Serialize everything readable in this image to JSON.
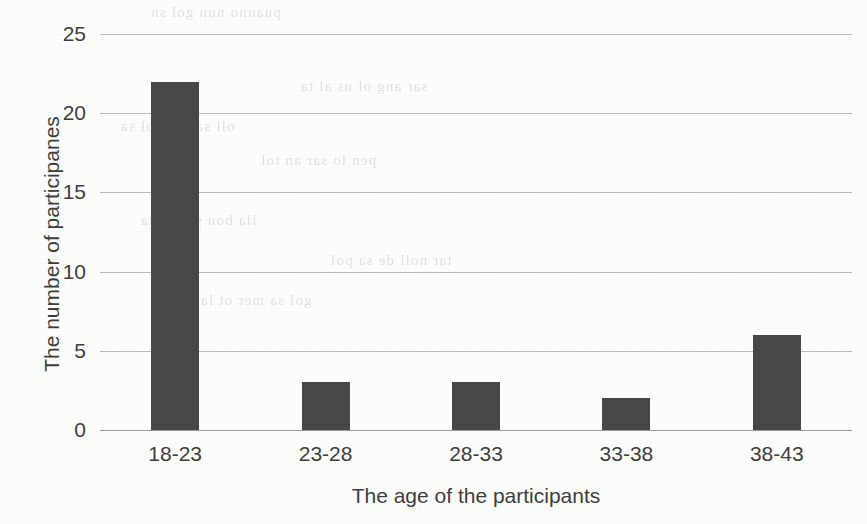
{
  "chart_data": {
    "type": "bar",
    "title": "",
    "subtitle": "",
    "xlabel": "The age of the participants",
    "ylabel": "The number of participanes",
    "categories": [
      "18-23",
      "23-28",
      "28-33",
      "33-38",
      "38-43"
    ],
    "values": [
      22,
      3,
      3,
      2,
      6
    ],
    "series": [
      {
        "name": "The number of participanes",
        "values": [
          22,
          3,
          3,
          2,
          6
        ]
      }
    ],
    "ylim": [
      0,
      25
    ],
    "y_ticks": [
      0,
      5,
      10,
      15,
      20,
      25
    ],
    "y_tick_labels": [
      "0",
      "5",
      "10",
      "15",
      "20",
      "25"
    ],
    "grid": true,
    "grid_axis": "y",
    "legend": false,
    "legend_position": "none",
    "bar_color": "#474747",
    "grid_color": "#b9b9b9",
    "text_color": "#3d3d3d",
    "background_color": "#fdfdfc"
  },
  "axes": {
    "y_title": "The number of participanes",
    "x_title": "The age of the participants",
    "y_ticks": [
      {
        "label": "25",
        "value": 25
      },
      {
        "label": "20",
        "value": 20
      },
      {
        "label": "15",
        "value": 15
      },
      {
        "label": "10",
        "value": 10
      },
      {
        "label": "5",
        "value": 5
      },
      {
        "label": "0",
        "value": 0
      }
    ],
    "x_ticks": [
      {
        "label": "18-23"
      },
      {
        "label": "23-28"
      },
      {
        "label": "28-33"
      },
      {
        "label": "33-38"
      },
      {
        "label": "38-43"
      }
    ]
  },
  "scan_artifacts": {
    "ghost_lines": [
      "puanno nun gol sn",
      "sar ang ol us al ta",
      "oll sa ora dol sa",
      "pen lo sar an tol",
      "ila bon ser no la",
      "tar noll de sa pol",
      "gol sa mer ot la"
    ]
  }
}
